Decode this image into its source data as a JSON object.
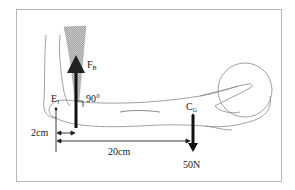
{
  "diagram": {
    "type": "forearm lever / biomechanics",
    "labels": {
      "force_biceps": "F",
      "force_biceps_sub": "B",
      "angle": "90°",
      "elbow_joint": "E",
      "elbow_joint_sub": "J",
      "center_gravity": "C",
      "center_gravity_sub": "G",
      "dist_short": "2cm",
      "dist_long": "20cm",
      "load": "50N"
    },
    "colors": {
      "line": "#222222",
      "outline": "#8a8a8a",
      "muscle": "#a9a9a9",
      "frame": "#b8b8b8"
    }
  }
}
